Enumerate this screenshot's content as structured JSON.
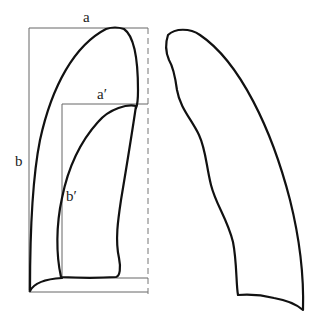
{
  "diagram": {
    "left_figure": {
      "outer_box": {
        "width_label": "a",
        "height_label": "b"
      },
      "inner_box": {
        "width_label": "a′",
        "height_label": "b′"
      }
    },
    "right_figure": {
      "description": "lung-shaped outline"
    }
  },
  "colors": {
    "stroke": "#111111",
    "guide": "#666666",
    "background": "#ffffff"
  }
}
